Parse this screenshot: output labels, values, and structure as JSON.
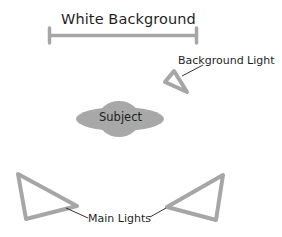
{
  "diagram": {
    "title": "White Background",
    "labels": {
      "background_light": "Background Light",
      "subject": "Subject",
      "main_lights": "Main Lights"
    },
    "colors": {
      "shape_gray": "#a6a6a6",
      "subject_fill": "#a8a8a8",
      "text": "#1f1f1f",
      "leader_line": "#333333",
      "background": "#ffffff"
    },
    "elements": [
      {
        "id": "white-background",
        "type": "bar",
        "label": "White Background"
      },
      {
        "id": "background-light",
        "type": "triangle",
        "label": "Background Light"
      },
      {
        "id": "subject",
        "type": "ellipse",
        "label": "Subject"
      },
      {
        "id": "main-light-left",
        "type": "triangle",
        "label": "Main Lights"
      },
      {
        "id": "main-light-right",
        "type": "triangle",
        "label": "Main Lights"
      }
    ]
  }
}
